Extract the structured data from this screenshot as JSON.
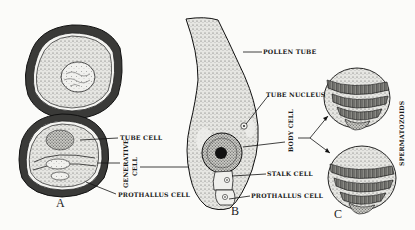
{
  "figure": {
    "panels": {
      "a": {
        "letter": "A"
      },
      "b": {
        "letter": "B"
      },
      "c": {
        "letter": "C"
      }
    },
    "labels": {
      "tube_cell": "TUBE CELL",
      "generative_cell_line1": "GENERATIVE",
      "generative_cell_line2": "CELL",
      "prothallus_cell_a": "PROTHALLUS CELL",
      "pollen_tube": "POLLEN TUBE",
      "tube_nucleus": "TUBE NUCLEUS",
      "body_cell": "BODY CELL",
      "stalk_cell": "STALK CELL",
      "prothallus_cell_b": "PROTHALLUS CELL",
      "spermatozoids": "SPERMATOZOIDS"
    },
    "colors": {
      "ink": "#1a1a1a",
      "paper": "#fbfbf9",
      "stipple": "#cfcfcb"
    }
  }
}
